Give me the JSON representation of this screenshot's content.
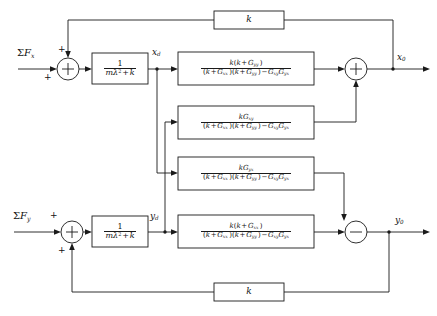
{
  "diagram": {
    "type": "control-block-diagram",
    "line_color": "#1a1a1a",
    "background": "#ffffff"
  },
  "signals": {
    "input_x": "ΣF",
    "input_x_sub": "x",
    "input_y": "ΣF",
    "input_y_sub": "y",
    "mid_x": "x",
    "mid_x_sub": "d",
    "mid_y": "y",
    "mid_y_sub": "d",
    "output_x": "x",
    "output_x_sub": "0",
    "output_y": "y",
    "output_y_sub": "0"
  },
  "junctions": [
    {
      "id": "sum-x-input",
      "sign_main": "+",
      "sign_feedback": "+",
      "operator": "+"
    },
    {
      "id": "sum-x-output",
      "operator": "+"
    },
    {
      "id": "sum-y-input",
      "sign_main": "+",
      "sign_feedback": "+",
      "operator": "+"
    },
    {
      "id": "sum-y-output",
      "operator": "−"
    }
  ],
  "blocks": {
    "plant_x": {
      "name": "plant-x",
      "numerator": "1",
      "denominator_m": "m",
      "denominator_lambda": "λ",
      "denominator_exp": "2",
      "denominator_tail": "+ k"
    },
    "plant_y": {
      "name": "plant-y",
      "numerator": "1",
      "denominator_m": "m",
      "denominator_lambda": "λ",
      "denominator_exp": "2",
      "denominator_tail": "+ k"
    },
    "gxx_direct": {
      "name": "direct-path-x",
      "numerator": "k(k + G",
      "numerator_sub": "yy",
      "numerator_tail": ")",
      "denominator": "(k + G xx )(k + G yy ) − G xy G yx"
    },
    "gxy_cross": {
      "name": "cross-coupling-xy",
      "numerator": "kG",
      "numerator_sub": "xy",
      "denominator": "(k + G xx )(k + G yy ) − G xy G yx"
    },
    "gyx_cross": {
      "name": "cross-coupling-yx",
      "numerator": "kG",
      "numerator_sub": "yx",
      "denominator": "(k + G xx )(k + G yy ) − G xy G yx"
    },
    "gyy_direct": {
      "name": "direct-path-y",
      "numerator": "k(k + G",
      "numerator_sub": "xx",
      "numerator_tail": ")",
      "denominator": "(k + G xx )(k + G yy ) − G xy G yx"
    },
    "feedback_top": {
      "name": "feedback-gain-top",
      "label": "k"
    },
    "feedback_bottom": {
      "name": "feedback-gain-bottom",
      "label": "k"
    }
  },
  "symbols": {
    "k": "k",
    "m": "m",
    "lambda": "λ",
    "G": "G",
    "plus": "+",
    "minus": "−",
    "sum": "Σ",
    "sub_xx": "xx",
    "sub_yy": "yy",
    "sub_xy": "xy",
    "sub_yx": "yx"
  }
}
